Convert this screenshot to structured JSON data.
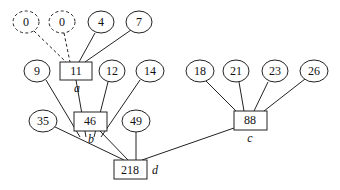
{
  "diagram": {
    "type": "tree",
    "leaves": {
      "dummy_0a": "0",
      "dummy_0b": "0",
      "n4": "4",
      "n7": "7",
      "n9": "9",
      "n12": "12",
      "n14": "14",
      "n18": "18",
      "n21": "21",
      "n23": "23",
      "n26": "26",
      "n35": "35",
      "n49": "49"
    },
    "internal": {
      "a": {
        "value": "11",
        "tag": "a"
      },
      "b": {
        "value": "46",
        "tag": "b"
      },
      "c": {
        "value": "88",
        "tag": "c"
      },
      "d": {
        "value": "218",
        "tag": "d"
      }
    },
    "edges": [
      [
        "dummy_0a",
        "a",
        "dashed"
      ],
      [
        "dummy_0b",
        "a",
        "dashed"
      ],
      [
        "n4",
        "a",
        "solid"
      ],
      [
        "n7",
        "a",
        "solid"
      ],
      [
        "n9",
        "b",
        "solid"
      ],
      [
        "a",
        "b",
        "solid"
      ],
      [
        "n12",
        "b",
        "solid"
      ],
      [
        "n14",
        "b",
        "solid"
      ],
      [
        "n18",
        "c",
        "solid"
      ],
      [
        "n21",
        "c",
        "solid"
      ],
      [
        "n23",
        "c",
        "solid"
      ],
      [
        "n26",
        "c",
        "solid"
      ],
      [
        "n35",
        "d",
        "solid"
      ],
      [
        "b",
        "d",
        "solid"
      ],
      [
        "n49",
        "d",
        "solid"
      ],
      [
        "c",
        "d",
        "solid"
      ]
    ]
  }
}
